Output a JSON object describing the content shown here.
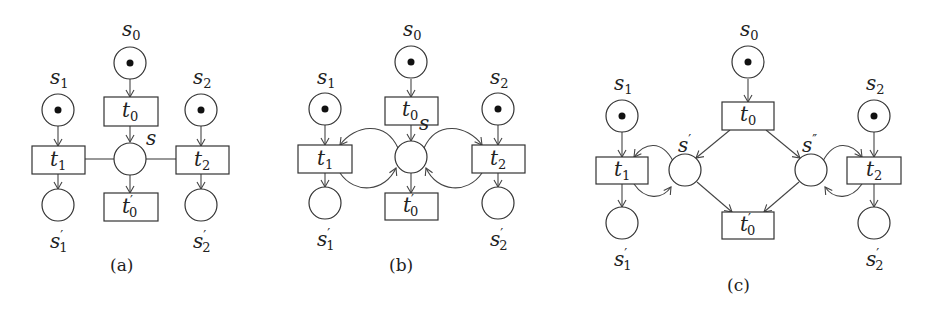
{
  "figure": {
    "panels": [
      {
        "id": "a",
        "caption": "(a)",
        "places": [
          {
            "name": "s",
            "sub": "0",
            "prime": "",
            "token": true
          },
          {
            "name": "s",
            "sub": "1",
            "prime": "",
            "token": true
          },
          {
            "name": "s",
            "sub": "2",
            "prime": "",
            "token": true
          },
          {
            "name": "s",
            "sub": "",
            "prime": "",
            "token": false
          },
          {
            "name": "s",
            "sub": "1",
            "prime": "′",
            "token": false
          },
          {
            "name": "s",
            "sub": "2",
            "prime": "′",
            "token": false
          }
        ],
        "transitions": [
          {
            "name": "t",
            "sub": "0",
            "prime": ""
          },
          {
            "name": "t",
            "sub": "1",
            "prime": ""
          },
          {
            "name": "t",
            "sub": "2",
            "prime": ""
          },
          {
            "name": "t",
            "sub": "0",
            "prime": "′"
          }
        ],
        "description": "Shared place s connected to t1 and t2 by undirected read arcs"
      },
      {
        "id": "b",
        "caption": "(b)",
        "places": [
          {
            "name": "s",
            "sub": "0",
            "prime": "",
            "token": true
          },
          {
            "name": "s",
            "sub": "1",
            "prime": "",
            "token": true
          },
          {
            "name": "s",
            "sub": "2",
            "prime": "",
            "token": true
          },
          {
            "name": "s",
            "sub": "",
            "prime": "",
            "token": false
          },
          {
            "name": "s",
            "sub": "1",
            "prime": "′",
            "token": false
          },
          {
            "name": "s",
            "sub": "2",
            "prime": "′",
            "token": false
          }
        ],
        "transitions": [
          {
            "name": "t",
            "sub": "0",
            "prime": ""
          },
          {
            "name": "t",
            "sub": "1",
            "prime": ""
          },
          {
            "name": "t",
            "sub": "2",
            "prime": ""
          },
          {
            "name": "t",
            "sub": "0",
            "prime": "′"
          }
        ],
        "description": "Read arcs replaced by consume/produce loops between s and t1, t2"
      },
      {
        "id": "c",
        "caption": "(c)",
        "places": [
          {
            "name": "s",
            "sub": "0",
            "prime": "",
            "token": true
          },
          {
            "name": "s",
            "sub": "1",
            "prime": "",
            "token": true
          },
          {
            "name": "s",
            "sub": "2",
            "prime": "",
            "token": true
          },
          {
            "name": "s",
            "sub": "",
            "prime": "′",
            "token": false
          },
          {
            "name": "s",
            "sub": "",
            "prime": "″",
            "token": false
          },
          {
            "name": "s",
            "sub": "1",
            "prime": "′",
            "token": false
          },
          {
            "name": "s",
            "sub": "2",
            "prime": "′",
            "token": false
          }
        ],
        "transitions": [
          {
            "name": "t",
            "sub": "0",
            "prime": ""
          },
          {
            "name": "t",
            "sub": "1",
            "prime": ""
          },
          {
            "name": "t",
            "sub": "2",
            "prime": ""
          },
          {
            "name": "t",
            "sub": "0",
            "prime": "′"
          }
        ],
        "description": "Place s split into s′ and s″, each looped with t1 and t2 respectively"
      }
    ]
  },
  "labels": {
    "a": {
      "s0": "s",
      "s0_sub": "0",
      "s1": "s",
      "s1_sub": "1",
      "s2": "s",
      "s2_sub": "2",
      "s": "s",
      "s1p": "s",
      "s1p_sup": "′",
      "s1p_sub": "1",
      "s2p": "s",
      "s2p_sup": "′",
      "s2p_sub": "2",
      "t0": "t",
      "t0_sub": "0",
      "t1": "t",
      "t1_sub": "1",
      "t2": "t",
      "t2_sub": "2",
      "t0p": "t",
      "t0p_sup": "′",
      "t0p_sub": "0",
      "caption": "(a)"
    },
    "b": {
      "s0": "s",
      "s0_sub": "0",
      "s1": "s",
      "s1_sub": "1",
      "s2": "s",
      "s2_sub": "2",
      "s": "s",
      "s1p": "s",
      "s1p_sup": "′",
      "s1p_sub": "1",
      "s2p": "s",
      "s2p_sup": "′",
      "s2p_sub": "2",
      "t0": "t",
      "t0_sub": "0",
      "t1": "t",
      "t1_sub": "1",
      "t2": "t",
      "t2_sub": "2",
      "t0p": "t",
      "t0p_sup": "′",
      "t0p_sub": "0",
      "caption": "(b)"
    },
    "c": {
      "s0": "s",
      "s0_sub": "0",
      "s1": "s",
      "s1_sub": "1",
      "s2": "s",
      "s2_sub": "2",
      "sp": "s",
      "sp_sup": "′",
      "spp": "s",
      "spp_sup": "″",
      "s1p": "s",
      "s1p_sup": "′",
      "s1p_sub": "1",
      "s2p": "s",
      "s2p_sup": "′",
      "s2p_sub": "2",
      "t0": "t",
      "t0_sub": "0",
      "t1": "t",
      "t1_sub": "1",
      "t2": "t",
      "t2_sub": "2",
      "t0p": "t",
      "t0p_sup": "′",
      "t0p_sub": "0",
      "caption": "(c)"
    }
  },
  "colors": {
    "stroke": "#333333",
    "token": "#111111",
    "background": "#ffffff"
  }
}
